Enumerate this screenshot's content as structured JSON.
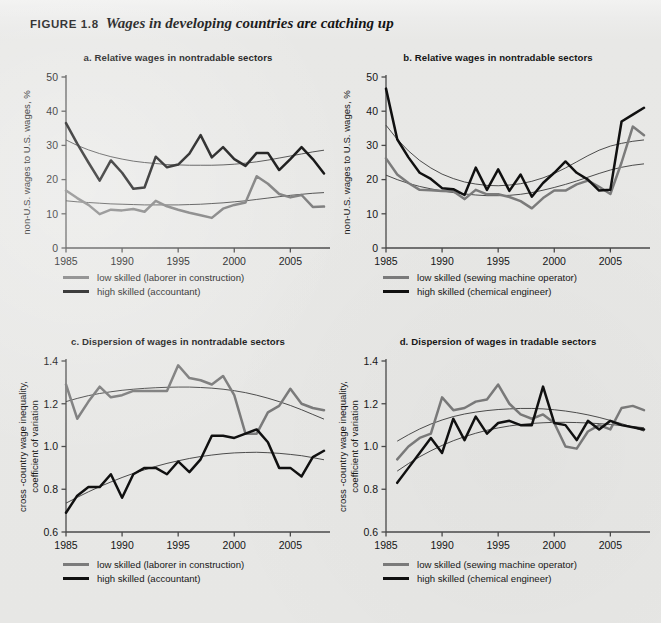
{
  "figure": {
    "label": "FIGURE 1.8",
    "title": "Wages in developing countries are catching up"
  },
  "colors": {
    "low_skilled": "#7b7b7b",
    "high_skilled": "#101010",
    "trend": "#3a3a3a",
    "axis": "#4a4a4a",
    "background": "#e8e8e6"
  },
  "legends": {
    "nontradable": {
      "low": "low skilled (laborer in construction)",
      "high": "high skilled (accountant)"
    },
    "tradable": {
      "low": "low skilled (sewing machine operator)",
      "high": "high skilled (chemical engineer)"
    }
  },
  "chart_data": [
    {
      "id": "panel-a",
      "type": "line",
      "title": "a.  Relative wages in nontradable sectors",
      "xlabel": "",
      "ylabel": "non-U.S. wages to U.S. wages, %",
      "xlim": [
        1985,
        2008
      ],
      "ylim": [
        0,
        50
      ],
      "yticks": [
        0,
        10,
        20,
        30,
        40,
        50
      ],
      "xticks": [
        1985,
        1990,
        1995,
        2000,
        2005
      ],
      "grid": false,
      "legend_position": "below",
      "x": [
        1985,
        1986,
        1987,
        1988,
        1989,
        1990,
        1991,
        1992,
        1993,
        1994,
        1995,
        1996,
        1997,
        1998,
        1999,
        2000,
        2001,
        2002,
        2003,
        2004,
        2005,
        2006,
        2007,
        2008
      ],
      "series": [
        {
          "name": "low skilled (laborer in construction)",
          "color": "#7b7b7b",
          "values": [
            16.8,
            14.6,
            12.6,
            9.9,
            11.2,
            11.0,
            11.4,
            10.6,
            13.8,
            12.2,
            11.2,
            10.3,
            9.6,
            8.8,
            11.5,
            12.6,
            13.3,
            21.0,
            18.8,
            15.8,
            14.8,
            15.5,
            12.0,
            12.1
          ],
          "trend": [
            13.8,
            13.5,
            13.3,
            13.1,
            12.9,
            12.8,
            12.7,
            12.6,
            12.6,
            12.6,
            12.6,
            12.7,
            12.8,
            13.0,
            13.2,
            13.5,
            13.8,
            14.2,
            14.6,
            15.0,
            15.4,
            15.7,
            16.0,
            16.2
          ]
        },
        {
          "name": "high skilled (accountant)",
          "color": "#101010",
          "values": [
            36.5,
            30.5,
            25.0,
            19.7,
            25.6,
            22.0,
            17.3,
            17.7,
            26.7,
            23.6,
            24.4,
            27.6,
            33.0,
            26.5,
            29.5,
            26.0,
            24.0,
            27.8,
            27.8,
            22.8,
            26.0,
            29.5,
            26.0,
            21.8
          ],
          "trend": [
            31.6,
            30.0,
            28.7,
            27.6,
            26.7,
            26.0,
            25.4,
            25.0,
            24.7,
            24.4,
            24.3,
            24.2,
            24.2,
            24.2,
            24.3,
            24.5,
            24.8,
            25.2,
            25.7,
            26.3,
            26.9,
            27.5,
            28.1,
            28.6
          ]
        }
      ]
    },
    {
      "id": "panel-b",
      "type": "line",
      "title": "b.  Relative wages in nontradable sectors",
      "xlabel": "",
      "ylabel": "non-U.S. wages to U.S. wages, %",
      "xlim": [
        1985,
        2008
      ],
      "ylim": [
        0,
        50
      ],
      "yticks": [
        0,
        10,
        20,
        30,
        40,
        50
      ],
      "xticks": [
        1985,
        1990,
        1995,
        2000,
        2005
      ],
      "grid": false,
      "legend_position": "below",
      "x": [
        1985,
        1986,
        1987,
        1988,
        1989,
        1990,
        1991,
        1992,
        1993,
        1994,
        1995,
        1996,
        1997,
        1998,
        1999,
        2000,
        2001,
        2002,
        2003,
        2004,
        2005,
        2006,
        2007,
        2008
      ],
      "series": [
        {
          "name": "low skilled (sewing machine operator)",
          "color": "#7b7b7b",
          "values": [
            26.2,
            21.5,
            19.0,
            17.0,
            16.9,
            16.7,
            16.6,
            14.3,
            17.0,
            15.7,
            15.7,
            14.9,
            13.7,
            11.6,
            14.6,
            16.8,
            16.8,
            18.6,
            19.7,
            17.9,
            15.8,
            25.0,
            35.5,
            33.0
          ],
          "trend": [
            21.3,
            20.0,
            18.9,
            18.0,
            17.3,
            16.7,
            16.2,
            15.8,
            15.5,
            15.3,
            15.3,
            15.4,
            15.7,
            16.2,
            16.9,
            17.7,
            18.6,
            19.6,
            20.7,
            21.8,
            22.8,
            23.6,
            24.2,
            24.6
          ]
        },
        {
          "name": "high skilled (chemical engineer)",
          "color": "#101010",
          "values": [
            46.6,
            31.8,
            26.5,
            22.0,
            20.2,
            17.5,
            17.2,
            15.5,
            23.5,
            17.0,
            23.0,
            16.7,
            21.5,
            15.0,
            19.0,
            22.0,
            25.3,
            22.0,
            20.0,
            16.8,
            17.0,
            37.0,
            39.0,
            41.0
          ],
          "trend": [
            35.9,
            31.8,
            28.4,
            25.6,
            23.4,
            21.6,
            20.3,
            19.3,
            18.7,
            18.3,
            18.2,
            18.4,
            18.8,
            19.5,
            20.5,
            21.8,
            23.4,
            25.2,
            27.0,
            28.6,
            29.8,
            30.6,
            31.2,
            31.6
          ]
        }
      ]
    },
    {
      "id": "panel-c",
      "type": "line",
      "title": "c.  Dispersion of wages in nontradable sectors",
      "xlabel": "",
      "ylabel": "cross -country wage inequality, coefficient of variation",
      "xlim": [
        1985,
        2008
      ],
      "ylim": [
        0.6,
        1.4
      ],
      "yticks": [
        0.6,
        0.8,
        1.0,
        1.2,
        1.4
      ],
      "xticks": [
        1985,
        1990,
        1995,
        2000,
        2005
      ],
      "grid": false,
      "legend_position": "below",
      "x": [
        1985,
        1986,
        1987,
        1988,
        1989,
        1990,
        1991,
        1992,
        1993,
        1994,
        1995,
        1996,
        1997,
        1998,
        1999,
        2000,
        2001,
        2002,
        2003,
        2004,
        2005,
        2006,
        2007,
        2008
      ],
      "series": [
        {
          "name": "low skilled (laborer in construction)",
          "color": "#7b7b7b",
          "values": [
            1.29,
            1.13,
            1.21,
            1.28,
            1.23,
            1.24,
            1.26,
            1.26,
            1.26,
            1.26,
            1.38,
            1.32,
            1.31,
            1.29,
            1.33,
            1.24,
            1.06,
            1.06,
            1.16,
            1.19,
            1.27,
            1.2,
            1.18,
            1.17
          ],
          "trend": [
            1.21,
            1.225,
            1.238,
            1.248,
            1.256,
            1.263,
            1.268,
            1.272,
            1.275,
            1.277,
            1.278,
            1.278,
            1.276,
            1.273,
            1.268,
            1.261,
            1.252,
            1.24,
            1.226,
            1.21,
            1.192,
            1.172,
            1.15,
            1.128
          ]
        },
        {
          "name": "high skilled (accountant)",
          "color": "#101010",
          "values": [
            0.69,
            0.77,
            0.81,
            0.81,
            0.87,
            0.76,
            0.87,
            0.9,
            0.9,
            0.87,
            0.93,
            0.88,
            0.94,
            1.05,
            1.05,
            1.04,
            1.06,
            1.08,
            1.02,
            0.9,
            0.9,
            0.86,
            0.95,
            0.98
          ],
          "trend": [
            0.735,
            0.762,
            0.788,
            0.812,
            0.834,
            0.855,
            0.874,
            0.891,
            0.907,
            0.921,
            0.933,
            0.944,
            0.953,
            0.96,
            0.966,
            0.97,
            0.972,
            0.973,
            0.971,
            0.968,
            0.963,
            0.957,
            0.948,
            0.938
          ]
        }
      ]
    },
    {
      "id": "panel-d",
      "type": "line",
      "title": "d.  Dispersion of wages in tradable sectors",
      "xlabel": "",
      "ylabel": "cross -country wage inequality, coefficient of variation",
      "xlim": [
        1985,
        2008
      ],
      "ylim": [
        0.6,
        1.4
      ],
      "yticks": [
        0.6,
        0.8,
        1.0,
        1.2,
        1.4
      ],
      "xticks": [
        1985,
        1990,
        1995,
        2000,
        2005
      ],
      "grid": false,
      "legend_position": "below",
      "x": [
        1986,
        1987,
        1988,
        1989,
        1990,
        1991,
        1992,
        1993,
        1994,
        1995,
        1996,
        1997,
        1998,
        1999,
        2000,
        2001,
        2002,
        2003,
        2004,
        2005,
        2006,
        2007,
        2008
      ],
      "series": [
        {
          "name": "low skilled (sewing machine operator)",
          "color": "#7b7b7b",
          "values": [
            0.94,
            1.0,
            1.04,
            1.06,
            1.23,
            1.17,
            1.18,
            1.21,
            1.22,
            1.29,
            1.2,
            1.15,
            1.13,
            1.15,
            1.11,
            1.0,
            0.99,
            1.07,
            1.1,
            1.08,
            1.18,
            1.19,
            1.17
          ],
          "trend": [
            1.025,
            1.055,
            1.082,
            1.105,
            1.124,
            1.14,
            1.152,
            1.161,
            1.168,
            1.173,
            1.176,
            1.178,
            1.178,
            1.176,
            1.172,
            1.166,
            1.158,
            1.148,
            1.136,
            1.122,
            1.107,
            1.09,
            1.072
          ]
        },
        {
          "name": "high skilled (chemical engineer)",
          "color": "#101010",
          "values": [
            0.83,
            0.9,
            0.97,
            1.04,
            0.97,
            1.13,
            1.03,
            1.14,
            1.06,
            1.11,
            1.12,
            1.1,
            1.1,
            1.28,
            1.11,
            1.1,
            1.03,
            1.12,
            1.08,
            1.12,
            1.1,
            1.09,
            1.08
          ],
          "trend": [
            0.885,
            0.92,
            0.952,
            0.98,
            1.005,
            1.027,
            1.046,
            1.062,
            1.076,
            1.087,
            1.096,
            1.103,
            1.108,
            1.111,
            1.113,
            1.113,
            1.112,
            1.11,
            1.107,
            1.103,
            1.098,
            1.093,
            1.088
          ]
        }
      ]
    }
  ]
}
